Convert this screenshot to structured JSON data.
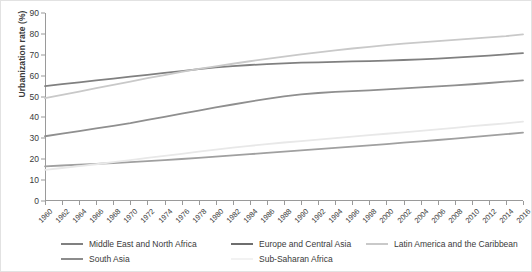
{
  "chart_data": {
    "type": "line",
    "title": "",
    "xlabel": "",
    "ylabel": "Urbanization rate (%)",
    "ylim": [
      0,
      90
    ],
    "ytick_labels": [
      "0",
      "10",
      "20",
      "30",
      "40",
      "50",
      "60",
      "70",
      "80",
      "90"
    ],
    "ytick_values": [
      0,
      10,
      20,
      30,
      40,
      50,
      60,
      70,
      80,
      90
    ],
    "grid": false,
    "legend_position": "bottom",
    "x": [
      1960,
      1962,
      1964,
      1966,
      1968,
      1970,
      1972,
      1974,
      1976,
      1978,
      1980,
      1982,
      1984,
      1986,
      1988,
      1990,
      1992,
      1994,
      1996,
      1998,
      2000,
      2002,
      2004,
      2006,
      2008,
      2010,
      2012,
      2014,
      2016
    ],
    "xtick_labels": [
      "1960",
      "1962",
      "1964",
      "1966",
      "1968",
      "1970",
      "1972",
      "1974",
      "1976",
      "1978",
      "1980",
      "1982",
      "1984",
      "1986",
      "1988",
      "1990",
      "1992",
      "1994",
      "1996",
      "1998",
      "2000",
      "2002",
      "2004",
      "2006",
      "2008",
      "2010",
      "2012",
      "2014",
      "2016"
    ],
    "series": [
      {
        "name": "Middle East and North Africa",
        "color": "#808080",
        "values": [
          55.0,
          55.9,
          56.8,
          57.7,
          58.6,
          59.5,
          60.4,
          61.3,
          62.2,
          63.1,
          64.0,
          64.6,
          65.1,
          65.5,
          65.9,
          66.2,
          66.4,
          66.6,
          66.8,
          67.0,
          67.2,
          67.5,
          67.8,
          68.2,
          68.6,
          69.1,
          69.6,
          70.2,
          70.8
        ]
      },
      {
        "name": "Europe and Central Asia",
        "color": "#8f8f8f",
        "values": [
          31.0,
          32.3,
          33.5,
          34.8,
          36.0,
          37.3,
          38.8,
          40.3,
          41.8,
          43.3,
          44.8,
          46.2,
          47.6,
          48.9,
          50.1,
          51.0,
          51.7,
          52.2,
          52.6,
          53.0,
          53.4,
          53.9,
          54.4,
          54.9,
          55.4,
          55.9,
          56.5,
          57.1,
          57.7
        ]
      },
      {
        "name": "Latin America and the Caribbean",
        "color": "#c9c9c9",
        "values": [
          49.2,
          50.8,
          52.4,
          54.0,
          55.6,
          57.2,
          58.8,
          60.3,
          61.8,
          63.2,
          64.5,
          65.7,
          66.9,
          68.0,
          69.1,
          70.2,
          71.2,
          72.1,
          73.0,
          73.8,
          74.6,
          75.3,
          75.9,
          76.5,
          77.1,
          77.7,
          78.3,
          78.9,
          79.8
        ]
      },
      {
        "name": "South Asia",
        "color": "#a0a0a0",
        "values": [
          16.6,
          17.0,
          17.4,
          17.8,
          18.2,
          18.6,
          19.1,
          19.6,
          20.1,
          20.6,
          21.2,
          21.8,
          22.4,
          23.0,
          23.6,
          24.2,
          24.8,
          25.4,
          26.0,
          26.6,
          27.2,
          27.9,
          28.5,
          29.2,
          29.9,
          30.6,
          31.3,
          32.0,
          32.7
        ]
      },
      {
        "name": "Sub-Saharan Africa",
        "color": "#e8e8e8",
        "values": [
          14.9,
          15.8,
          16.7,
          17.6,
          18.6,
          19.6,
          20.6,
          21.6,
          22.6,
          23.6,
          24.6,
          25.5,
          26.4,
          27.2,
          28.0,
          28.7,
          29.4,
          30.1,
          30.8,
          31.5,
          32.2,
          32.9,
          33.6,
          34.3,
          35.0,
          35.8,
          36.5,
          37.2,
          38.0
        ]
      }
    ]
  },
  "legend": {
    "row1": [
      {
        "label": "Middle East and North Africa",
        "color": "#808080",
        "left": 0
      },
      {
        "label": "Europe and Central Asia",
        "color": "#6e6e6e",
        "left": 170
      },
      {
        "label": "Latin America and the Caribbean",
        "color": "#c9c9c9",
        "left": 305
      }
    ],
    "row2": [
      {
        "label": "South Asia",
        "color": "#8c8c8c",
        "left": 0
      },
      {
        "label": "Sub-Saharan Africa",
        "color": "#f2f2f2",
        "left": 170
      }
    ]
  }
}
